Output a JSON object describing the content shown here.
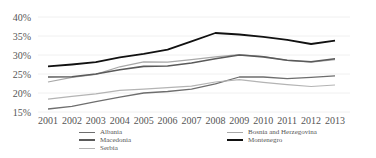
{
  "chart_data": {
    "type": "line",
    "title": "",
    "xlabel": "",
    "ylabel": "",
    "x": [
      "2001",
      "2002",
      "2003",
      "2004",
      "2005",
      "2006",
      "2007",
      "2008",
      "2009",
      "2010",
      "2011",
      "2012",
      "2013"
    ],
    "y_ticks": [
      "15%",
      "20%",
      "25%",
      "30%",
      "35%",
      "40%"
    ],
    "ylim": [
      15,
      40
    ],
    "grid": true,
    "legend_position": "bottom",
    "series": [
      {
        "name": "Albania",
        "color": "#6e6e6e",
        "width": 1.3,
        "values": [
          15.8,
          16.5,
          17.7,
          18.9,
          20.0,
          20.4,
          21.0,
          22.4,
          24.2,
          24.2,
          23.8,
          24.1,
          24.5
        ]
      },
      {
        "name": "Bosnia and Herzegovina",
        "color": "#a8a8a8",
        "width": 1.2,
        "values": [
          22.9,
          24.1,
          24.9,
          26.9,
          28.2,
          28.1,
          28.8,
          29.5,
          30.1,
          29.6,
          28.6,
          28.1,
          28.8
        ]
      },
      {
        "name": "Macedonia",
        "color": "#5a5a5a",
        "width": 1.6,
        "values": [
          24.2,
          24.3,
          25.0,
          26.1,
          27.0,
          27.1,
          27.9,
          29.0,
          30.0,
          29.5,
          28.6,
          28.2,
          29.0
        ]
      },
      {
        "name": "Montenegro",
        "color": "#111111",
        "width": 1.8,
        "values": [
          27.0,
          27.5,
          28.1,
          29.4,
          30.3,
          31.4,
          33.6,
          35.8,
          35.4,
          34.8,
          34.0,
          32.9,
          33.8
        ]
      },
      {
        "name": "Serbia",
        "color": "#b4b4b4",
        "width": 1.2,
        "values": [
          18.4,
          19.1,
          19.8,
          20.7,
          21.0,
          21.4,
          21.8,
          22.9,
          23.5,
          22.8,
          22.2,
          21.7,
          22.1
        ]
      }
    ]
  },
  "legend": {
    "left": [
      {
        "label": "Albania",
        "color": "#6e6e6e",
        "thick": 1.5
      },
      {
        "label": "Macedonia",
        "color": "#5a5a5a",
        "thick": 2
      },
      {
        "label": "Serbia",
        "color": "#b4b4b4",
        "thick": 1
      }
    ],
    "right": [
      {
        "label": "Bosnia and Herzegovina",
        "color": "#a8a8a8",
        "thick": 1
      },
      {
        "label": "Montenegro",
        "color": "#111111",
        "thick": 2.5
      }
    ]
  }
}
